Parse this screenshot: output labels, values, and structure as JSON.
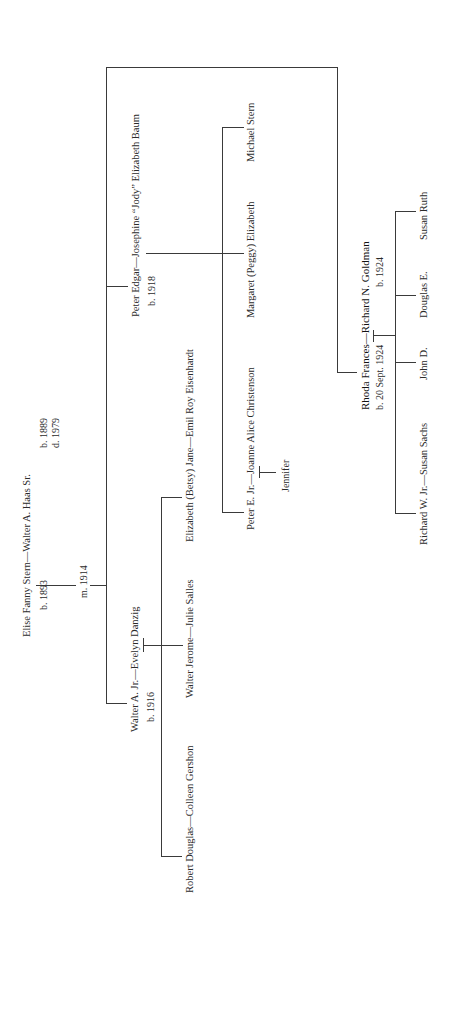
{
  "tree": {
    "root": {
      "couple": "Elise Fanny Stern—Walter A. Haas Sr.",
      "wife_born": "b. 1893",
      "husband_born": "b. 1889",
      "husband_died": "d. 1979",
      "married": "m. 1914"
    },
    "walter_jr": {
      "couple": "Walter A. Jr.—Evelyn Danzig",
      "born": "b. 1916",
      "children": [
        "Robert Douglas—Colleen Gershon",
        "Walter Jerome—Julie Salles",
        "Elizabeth (Betsy) Jane—Emil Roy Eisenhardt"
      ]
    },
    "peter_edgar": {
      "couple": "Peter Edgar—Josephine “Jody” Elizabeth Baum",
      "born": "b. 1918",
      "children": [
        "Peter E. Jr.—Joanne Alice Christenson",
        "Margaret (Peggy) Elizabeth",
        "Michael Stern"
      ],
      "grandchild": "Jennifer"
    },
    "rhoda": {
      "wife": "Rhoda Frances",
      "husband": "—Richard N. Goldman",
      "wife_born": "b. 20 Sept. 1924",
      "husband_born": "b. 1924",
      "children": [
        "Richard W. Jr.—Susan Sachs",
        "John D.",
        "Douglas E.",
        "Susan Ruth"
      ]
    }
  }
}
